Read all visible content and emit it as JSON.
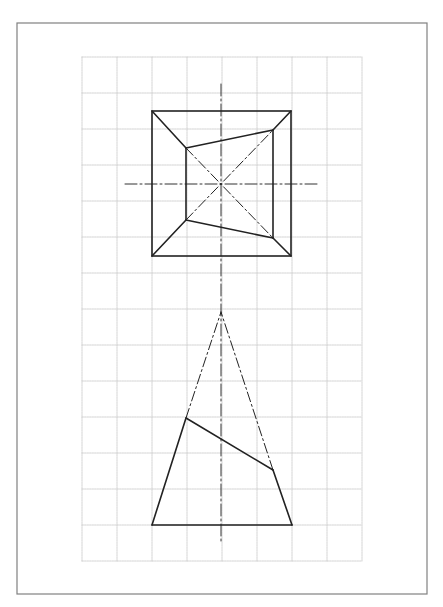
{
  "canvas": {
    "width": 443,
    "height": 607,
    "background": "#ffffff"
  },
  "colors": {
    "border": "#808080",
    "grid": "#c8c8c8",
    "outline": "#222222",
    "centerline": "#333333"
  },
  "frame": {
    "x": 17,
    "y": 23,
    "width": 410,
    "height": 571
  },
  "grid": {
    "x0": 82,
    "y0": 57,
    "cols": 8,
    "rows": 14,
    "cell_w": 35,
    "cell_h": 36
  },
  "top_view": {
    "outer_square": {
      "x": 152,
      "y": 111,
      "width": 139,
      "height": 145
    },
    "center": {
      "x": 221,
      "y": 184
    },
    "inner_quad": [
      [
        186,
        148
      ],
      [
        273,
        130
      ],
      [
        273,
        238
      ],
      [
        186,
        220
      ]
    ],
    "visible_edges": [
      [
        [
          152,
          111
        ],
        [
          186,
          148
        ]
      ],
      [
        [
          291,
          111
        ],
        [
          273,
          130
        ]
      ],
      [
        [
          152,
          256
        ],
        [
          186,
          220
        ]
      ],
      [
        [
          291,
          256
        ],
        [
          273,
          238
        ]
      ],
      [
        [
          186,
          148
        ],
        [
          273,
          130
        ]
      ],
      [
        [
          273,
          130
        ],
        [
          273,
          238
        ]
      ],
      [
        [
          273,
          238
        ],
        [
          186,
          220
        ]
      ],
      [
        [
          186,
          220
        ],
        [
          186,
          148
        ]
      ]
    ],
    "hidden_edges": [
      [
        [
          186,
          148
        ],
        [
          273,
          238
        ]
      ],
      [
        [
          186,
          220
        ],
        [
          273,
          130
        ]
      ]
    ],
    "centerline_h": [
      [
        125,
        184
      ],
      [
        318,
        184
      ]
    ]
  },
  "front_view": {
    "apex": [
      221,
      312
    ],
    "base": [
      [
        152,
        525
      ],
      [
        292,
        525
      ]
    ],
    "cut_left": [
      186,
      418
    ],
    "cut_right": [
      273,
      470
    ],
    "visible_edges": [
      [
        [
          152,
          525
        ],
        [
          292,
          525
        ]
      ],
      [
        [
          152,
          525
        ],
        [
          186,
          418
        ]
      ],
      [
        [
          292,
          525
        ],
        [
          273,
          470
        ]
      ],
      [
        [
          186,
          418
        ],
        [
          273,
          470
        ]
      ]
    ],
    "hidden_edges": [
      [
        [
          186,
          418
        ],
        [
          221,
          312
        ]
      ],
      [
        [
          273,
          470
        ],
        [
          221,
          312
        ]
      ]
    ]
  },
  "centerline_v": [
    [
      221,
      84
    ],
    [
      221,
      542
    ]
  ]
}
